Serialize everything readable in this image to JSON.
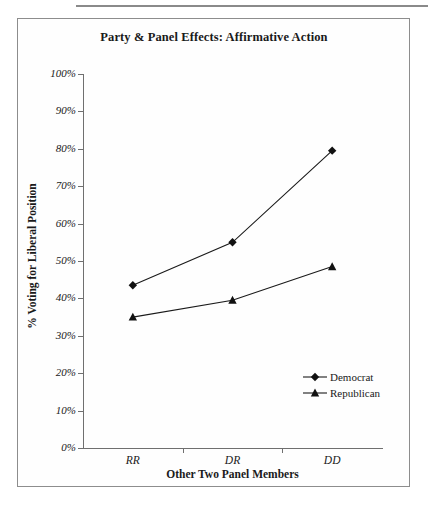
{
  "chart_data": {
    "type": "line",
    "title": "Party & Panel Effects: Affirmative Action",
    "xlabel": "Other Two Panel Members",
    "ylabel": "% Voting for Liberal Position",
    "categories": [
      "RR",
      "DR",
      "DD"
    ],
    "series": [
      {
        "name": "Democrat",
        "marker": "diamond",
        "values": [
          43.5,
          55.0,
          79.5
        ]
      },
      {
        "name": "Republican",
        "marker": "triangle",
        "values": [
          35.0,
          39.5,
          48.5
        ]
      }
    ],
    "ylim": [
      0,
      100
    ],
    "ytick_labels": [
      "100%",
      "90%",
      "80%",
      "70%",
      "60%",
      "50%",
      "40%",
      "30%",
      "20%",
      "10%",
      "0%"
    ],
    "ytick_values": [
      100,
      90,
      80,
      70,
      60,
      50,
      40,
      30,
      20,
      10,
      0
    ],
    "grid": false,
    "legend_position": "lower-right",
    "line_color": "#1a1a1a",
    "marker_color": "#111111"
  },
  "legend": {
    "entries": [
      {
        "label": "Democrat"
      },
      {
        "label": "Republican"
      }
    ]
  }
}
